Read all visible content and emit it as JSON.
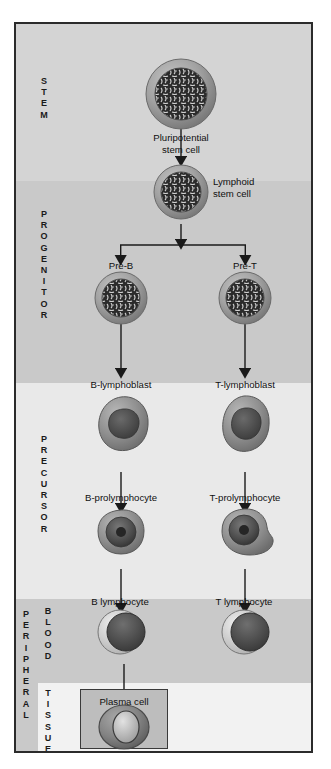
{
  "figure": {
    "border_color": "#2b2b2b",
    "background": "#e8e8e8"
  },
  "stages": [
    {
      "id": "stem",
      "label": "S\nT\nE\nM",
      "plain": "STEM",
      "band_color": "#d4d4d4"
    },
    {
      "id": "progenitor",
      "label": "P\nR\nO\nG\nE\nN\nI\nT\nO\nR",
      "plain": "PROGENITOR",
      "band_color": "#c9c9c9"
    },
    {
      "id": "precursor",
      "label": "P\nR\nE\nC\nU\nR\nS\nO\nR",
      "plain": "PRECURSOR",
      "band_color": "#e9e9e9"
    },
    {
      "id": "peripheral",
      "label": "P\nE\nR\nI\nP\nH\nE\nR\nA\nL",
      "plain": "PERIPHERAL",
      "band_color": "#c9c9c9"
    },
    {
      "id": "blood",
      "label": "B\nL\nO\nO\nD",
      "plain": "BLOOD",
      "band_color": "#c9c9c9"
    },
    {
      "id": "tissue",
      "label": "T\nI\nS\nS\nU\nE",
      "plain": "TISSUE",
      "band_color": "#f2f2f2"
    }
  ],
  "cells": {
    "pluripotential_stem": {
      "label": "Pluripotential\nstem cell",
      "stage": "stem",
      "type": "mottled-nucleus"
    },
    "lymphoid_stem": {
      "label": "Lymphoid\nstem cell",
      "stage": "stem",
      "type": "mottled-nucleus"
    },
    "pre_b": {
      "label": "Pre-B",
      "stage": "progenitor",
      "type": "mottled-nucleus"
    },
    "pre_t": {
      "label": "Pre-T",
      "stage": "progenitor",
      "type": "mottled-nucleus"
    },
    "b_lymphoblast": {
      "label": "B-lymphoblast",
      "stage": "precursor",
      "type": "blast"
    },
    "t_lymphoblast": {
      "label": "T-lymphoblast",
      "stage": "precursor",
      "type": "blast"
    },
    "b_prolymphocyte": {
      "label": "B-prolymphocyte",
      "stage": "precursor",
      "type": "prolymphocyte"
    },
    "t_prolymphocyte": {
      "label": "T-prolymphocyte",
      "stage": "precursor",
      "type": "prolymphocyte"
    },
    "b_lymphocyte": {
      "label": "B lymphocyte",
      "stage": "blood",
      "type": "lymphocyte"
    },
    "t_lymphocyte": {
      "label": "T lymphocyte",
      "stage": "blood",
      "type": "lymphocyte"
    },
    "plasma_cell": {
      "label": "Plasma cell",
      "stage": "tissue",
      "type": "plasma"
    }
  },
  "lineages": {
    "b_cell_column_label": "B",
    "t_cell_column_label": "T"
  },
  "colors": {
    "cell_membrane": "#9a9a9a",
    "cell_nucleus_dark": "#2a2a2a",
    "cell_cytoplasm_light": "#d8d8d8",
    "arrow": "#1a1a1a",
    "text": "#101010",
    "plasma_box_fill": "#bdbdbd"
  }
}
